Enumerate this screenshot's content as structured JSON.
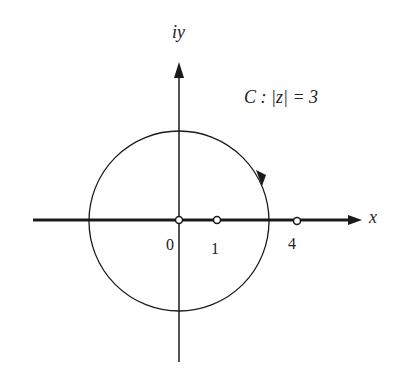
{
  "figure": {
    "axis_x_label": "x",
    "axis_y_label": "iy",
    "curve_label": "C : |z| = 3",
    "ticks": [
      {
        "label": "0",
        "value": 0
      },
      {
        "label": "1",
        "value": 1
      },
      {
        "label": "4",
        "value": 4
      }
    ],
    "circle": {
      "center": [
        0,
        0
      ],
      "radius": 3,
      "orientation": "counterclockwise"
    },
    "marked_points": [
      0,
      1,
      4
    ],
    "colors": {
      "stroke": "#1a1a1a",
      "background": "#ffffff"
    }
  }
}
